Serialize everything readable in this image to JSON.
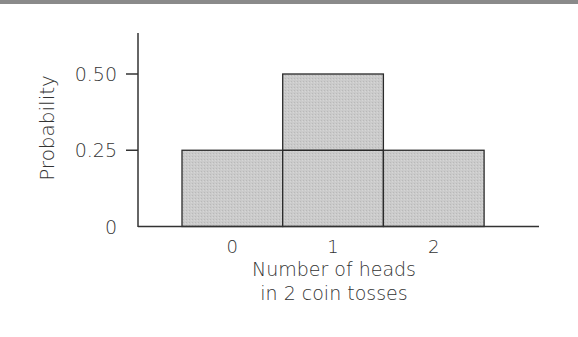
{
  "chart_data": {
    "type": "bar",
    "title": "",
    "xlabel": "Number of heads in 2 coin tosses",
    "xlabel_lines": [
      "Number of heads",
      "in 2 coin tosses"
    ],
    "ylabel": "Probability",
    "categories": [
      "0",
      "1",
      "2"
    ],
    "values": [
      0.25,
      0.5,
      0.25
    ],
    "yticks": [
      "0",
      "0.25",
      "0.50"
    ],
    "ylim": [
      0,
      0.63
    ],
    "grid": false,
    "legend": null,
    "bar_style": "histogram, adjacent bars, gray stippled fill with dark outline",
    "colors": {
      "bar_fill": "#c8c8c8",
      "bar_stroke": "#2a2a2a",
      "axis": "#333333",
      "top_rule": "#8a8a8a"
    }
  }
}
